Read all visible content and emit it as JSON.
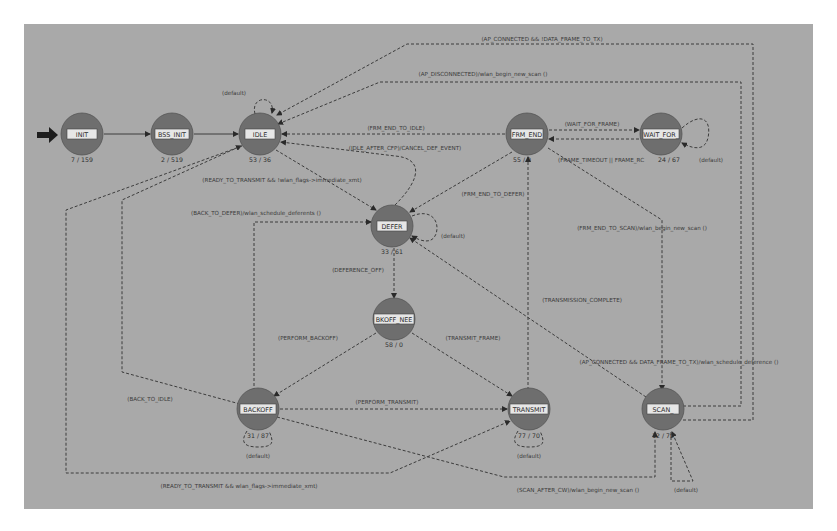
{
  "diagram": {
    "type": "state-machine",
    "colors": {
      "canvas": "#a9a9a9",
      "state_fill": "#6e6e6e",
      "state_band": "#e6e6e6",
      "edge": "#3c3c3c",
      "entry_arrow": "#1e1e1e"
    },
    "states": [
      {
        "id": "init",
        "name": "INIT",
        "counts": "7 / 159"
      },
      {
        "id": "bss_init",
        "name": "BSS_INIT",
        "counts": "2 / 519"
      },
      {
        "id": "idle",
        "name": "IDLE",
        "counts": "53 / 36"
      },
      {
        "id": "frm_end",
        "name": "FRM_END",
        "counts": "55 / 0"
      },
      {
        "id": "wait_for",
        "name": "WAIT_FOR_",
        "counts": "24 / 67"
      },
      {
        "id": "defer",
        "name": "DEFER",
        "counts": "33 / 61"
      },
      {
        "id": "bkoff_nee",
        "name": "BKOFF_NEE",
        "counts": "58 / 0"
      },
      {
        "id": "backoff",
        "name": "BACKOFF",
        "counts": "31 / 87"
      },
      {
        "id": "transmit",
        "name": "TRANSMIT",
        "counts": "77 / 70"
      },
      {
        "id": "scan",
        "name": "SCAN_",
        "counts": "12 / 70"
      }
    ],
    "transitions": {
      "ap_connected_data_frame": "(AP_CONNECTED && !DATA_FRAME_TO_TX)",
      "ap_disconnected": "(AP_DISCONNECTED)/wlan_begin_new_scan ()",
      "idle_default": "(default)",
      "frm_end_to_idle": "(FRM_END_TO_IDLE)",
      "idle_after_cfp": "(IDLE_AFTER_CFP)/CANCEL_DEF_EVENT)",
      "wait_for_frame": "(WAIT_FOR_FRAME)",
      "frame_timeout": "(FRAME_TIMEOUT || FRAME_RC",
      "wait_for_default": "(default)",
      "ready_to_transmit_top": "(READY_TO_TRANSMIT && !wlan_flags->immediate_xmt)",
      "back_to_defer": "(BACK_TO_DEFER)/wlan_schedule_deferents ()",
      "frm_end_to_defer": "(FRM_END_TO_DEFER)",
      "defer_default": "(default)",
      "frm_end_to_scan": "(FRM_END_TO_SCAN)/wlan_begin_new_scan ()",
      "deference_off": "(DEFERENCE_OFF)",
      "perform_backoff": "(PERFORM_BACKOFF)",
      "transmit_frame": "(TRANSMIT_FRAME)",
      "transmission_complete": "(TRANSMISSION_COMPLETE)",
      "ap_connected_data_frame_to_tx": "(AP_CONNECTED && DATA_FRAME_TO_TX)/wlan_schedule_deference ()",
      "back_to_idle": "(BACK_TO_IDLE)",
      "perform_transmit": "(PERFORM_TRANSMIT)",
      "backoff_default": "(default)",
      "transmit_default": "(default)",
      "ready_to_transmit_bottom": "(READY_TO_TRANSMIT && wlan_flags->immediate_xmt)",
      "scan_after_cw": "(SCAN_AFTER_CW)/wlan_begin_new_scan ()",
      "scan_default": "(default)"
    }
  }
}
